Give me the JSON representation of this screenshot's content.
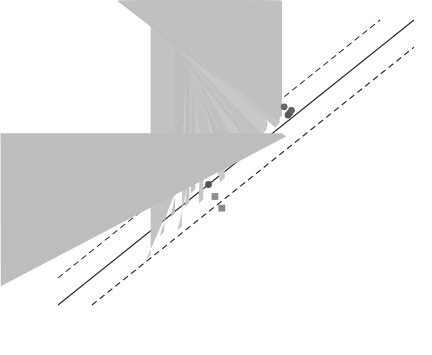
{
  "figure": {
    "background": "#ffffff",
    "frame_color": "#3a3a3a"
  },
  "axes": {
    "x": {
      "label_parts": {
        "prefix": "实测EC",
        "sub1": "10add",
        "mid1": "/NOEC",
        "sub2": "add",
        "mid2": "/LOEC",
        "sub3": "add",
        "suffix": "/(mg/kg)"
      },
      "label_plain": "实测EC10add/NOECadd/LOECadd/(mg/kg)",
      "ticks": [
        "0.1",
        "1",
        "10",
        "100",
        "1000",
        "10000"
      ],
      "min": 0.1,
      "max": 10000,
      "scale": "log"
    },
    "y": {
      "label_parts": {
        "prefix": "预测EC",
        "sub1": "10add",
        "mid1": "/NOEC",
        "sub2": "add",
        "mid2": "/LOEC",
        "sub3": "add",
        "suffix": "/(mg/kg)"
      },
      "label_plain": "预测EC10add/NOECadd/LOECadd/(mg/kg)",
      "ticks": [
        "0.1",
        "1",
        "10",
        "100",
        "1000",
        "10000"
      ],
      "min": 0.1,
      "max": 10000,
      "scale": "log"
    }
  },
  "species_legend": [
    {
      "label": "Cucumis sativus",
      "suffix": " L.",
      "italic": true,
      "color": "#8c8c8c"
    },
    {
      "label": "Ligustrum japonicum",
      "suffix": "",
      "italic": true,
      "color": "#595959"
    },
    {
      "label": "Lactuca sativa",
      "suffix": " T.",
      "italic": true,
      "color": "#d5d5d5"
    },
    {
      "label": "Triticum aestivum",
      "suffix": " L.",
      "italic": true,
      "color": "#c4c4c4"
    },
    {
      "label": "Eisenia andrei",
      "suffix": "",
      "italic": true,
      "color": "#616161"
    },
    {
      "label": "Lumbricus terrestris",
      "suffix": "",
      "italic": true,
      "color": "#9a9a9a"
    },
    {
      "label": "Aporrectodea caliginosa",
      "suffix": "",
      "italic": true,
      "color": "#9e9e9e"
    },
    {
      "label": "Eisenia fetida",
      "suffix": "",
      "italic": true,
      "color": "#8f8f8f"
    },
    {
      "label": "Enchytraeus crypticus",
      "suffix": "",
      "italic": true,
      "color": "#7a7a7a"
    },
    {
      "label": "Spinacia oleracea",
      "suffix": " L.",
      "italic": true,
      "color": "#a8a8a8"
    },
    {
      "label": "Sinella curviseta",
      "suffix": "",
      "italic": true,
      "color": "#4f4f4f"
    },
    {
      "label": "Hordeum vulgare",
      "suffix": " L.",
      "italic": true,
      "color": "#636363"
    },
    {
      "label": "PNR",
      "suffix": "",
      "italic": false,
      "color": "#c9c9c9"
    },
    {
      "label": "STR",
      "suffix": "",
      "italic": false,
      "color": "#dcdcdc"
    },
    {
      "label": "Q67",
      "suffix": "",
      "italic": false,
      "color": "#b0b0b0"
    }
  ],
  "symbol_legend": [
    {
      "name": "Cd",
      "sup": "",
      "shape": "circle"
    },
    {
      "name": "Pb",
      "sup": "",
      "shape": "circle"
    },
    {
      "name": "Zn",
      "sup": "",
      "shape": "circle"
    },
    {
      "name": "As",
      "sup": "3+",
      "shape": "square"
    },
    {
      "name": "Cu",
      "sup": "",
      "shape": "triangle-down"
    },
    {
      "name": "Cr",
      "sup": "6+",
      "shape": "triangle-up"
    },
    {
      "name": "Ni",
      "sup": "",
      "shape": "diamond"
    },
    {
      "name": "Sb",
      "sup": "3+",
      "shape": "star"
    }
  ],
  "line_legend": [
    {
      "label": "1：1线",
      "style": "solid"
    },
    {
      "label": "3倍范围",
      "style": "dashed"
    }
  ],
  "chart_data": {
    "type": "scatter",
    "title": "",
    "xlabel": "实测EC10add/NOECadd/LOECadd/(mg/kg)",
    "ylabel": "预测EC10add/NOECadd/LOECadd/(mg/kg)",
    "xlim": [
      0.1,
      10000
    ],
    "ylim": [
      0.1,
      10000
    ],
    "xscale": "log",
    "yscale": "log",
    "grid": false,
    "legend_position": "inside-top-left-and-top-center",
    "reference_lines": [
      {
        "name": "1:1线",
        "type": "identity",
        "slope": 1,
        "factor": 1,
        "style": "solid"
      },
      {
        "name": "3倍范围 upper",
        "type": "band",
        "slope": 1,
        "factor": 3,
        "style": "dashed"
      },
      {
        "name": "3倍范围 lower",
        "type": "band",
        "slope": 1,
        "factor": 0.3333,
        "style": "dashed"
      }
    ],
    "points": [
      {
        "x": 2.0,
        "y": 0.62,
        "shape": "triangle-up",
        "color": "#c2c2c2"
      },
      {
        "x": 3.1,
        "y": 1.6,
        "shape": "triangle-up",
        "color": "#c2c2c2"
      },
      {
        "x": 5.5,
        "y": 2.0,
        "shape": "triangle-up",
        "color": "#c8c8c8"
      },
      {
        "x": 4.4,
        "y": 3.4,
        "shape": "triangle-up",
        "color": "#bdbdbd"
      },
      {
        "x": 7.0,
        "y": 5.2,
        "shape": "triangle-up",
        "color": "#c4c4c4"
      },
      {
        "x": 8.5,
        "y": 9.0,
        "shape": "triangle-up",
        "color": "#bfbfbf"
      },
      {
        "x": 6.2,
        "y": 11.0,
        "shape": "triangle-up",
        "color": "#cccccc"
      },
      {
        "x": 11.0,
        "y": 6.0,
        "shape": "triangle-up",
        "color": "#c6c6c6"
      },
      {
        "x": 13.0,
        "y": 13.0,
        "shape": "circle",
        "color": "#555555"
      },
      {
        "x": 16.0,
        "y": 8.0,
        "shape": "square",
        "color": "#8f8f8f"
      },
      {
        "x": 15.0,
        "y": 19.0,
        "shape": "triangle-up",
        "color": "#c2c2c2"
      },
      {
        "x": 20.0,
        "y": 5.0,
        "shape": "square",
        "color": "#8a8a8a"
      },
      {
        "x": 22.0,
        "y": 14.0,
        "shape": "triangle-up",
        "color": "#c9c9c9"
      },
      {
        "x": 26.0,
        "y": 24.0,
        "shape": "triangle-up",
        "color": "#bdbdbd"
      },
      {
        "x": 30.0,
        "y": 45.0,
        "shape": "triangle-up",
        "color": "#c4c4c4"
      },
      {
        "x": 34.0,
        "y": 30.0,
        "shape": "triangle-up",
        "color": "#c0c0c0"
      },
      {
        "x": 40.0,
        "y": 62.0,
        "shape": "circle",
        "color": "#6b6b6b"
      },
      {
        "x": 44.0,
        "y": 42.0,
        "shape": "triangle-up",
        "color": "#c8c8c8"
      },
      {
        "x": 48.0,
        "y": 88.0,
        "shape": "triangle-up",
        "color": "#bfbfbf"
      },
      {
        "x": 55.0,
        "y": 120.0,
        "shape": "circle",
        "color": "#bcbcbc"
      },
      {
        "x": 60.0,
        "y": 75.0,
        "shape": "triangle-up",
        "color": "#c5c5c5"
      },
      {
        "x": 64.0,
        "y": 175.0,
        "shape": "circle",
        "color": "#c6c6c6"
      },
      {
        "x": 70.0,
        "y": 66.0,
        "shape": "triangle-up",
        "color": "#c1c1c1"
      },
      {
        "x": 78.0,
        "y": 150.0,
        "shape": "circle",
        "color": "#a3a3a3"
      },
      {
        "x": 85.0,
        "y": 98.0,
        "shape": "triangle-up",
        "color": "#c9c9c9"
      },
      {
        "x": 92.0,
        "y": 330.0,
        "shape": "circle",
        "color": "#c2c2c2"
      },
      {
        "x": 100.0,
        "y": 200.0,
        "shape": "triangle-up",
        "color": "#bebebe"
      },
      {
        "x": 110.0,
        "y": 420.0,
        "shape": "circle",
        "color": "#3f3f3f"
      },
      {
        "x": 120.0,
        "y": 260.0,
        "shape": "circle",
        "color": "#9c9c9c"
      },
      {
        "x": 130.0,
        "y": 130.0,
        "shape": "triangle-up",
        "color": "#c4c4c4"
      },
      {
        "x": 140.0,
        "y": 175.0,
        "shape": "triangle-up",
        "color": "#c0c0c0"
      },
      {
        "x": 150.0,
        "y": 300.0,
        "shape": "circle",
        "color": "#666666"
      },
      {
        "x": 160.0,
        "y": 90.0,
        "shape": "triangle-down",
        "color": "#bdbdbd"
      },
      {
        "x": 170.0,
        "y": 215.0,
        "shape": "circle",
        "color": "#5a5a5a"
      },
      {
        "x": 180.0,
        "y": 235.0,
        "shape": "circle",
        "color": "#585858"
      },
      {
        "x": 190.0,
        "y": 260.0,
        "shape": "circle",
        "color": "#616161"
      },
      {
        "x": 200.0,
        "y": 115.0,
        "shape": "star",
        "color": "#6e6e6e"
      },
      {
        "x": 210.0,
        "y": 75.0,
        "shape": "triangle-down",
        "color": "#c2c2c2"
      },
      {
        "x": 230.0,
        "y": 145.0,
        "shape": "triangle-down",
        "color": "#b8b8b8"
      },
      {
        "x": 250.0,
        "y": 58.0,
        "shape": "star",
        "color": "#b4b4b4"
      },
      {
        "x": 270.0,
        "y": 46.0,
        "shape": "star",
        "color": "#6a6a6a"
      },
      {
        "x": 290.0,
        "y": 300.0,
        "shape": "circle",
        "color": "#4a4a4a"
      },
      {
        "x": 310.0,
        "y": 180.0,
        "shape": "diamond",
        "color": "#9f9f9f"
      },
      {
        "x": 330.0,
        "y": 52.0,
        "shape": "diamond",
        "color": "#a8a8a8"
      },
      {
        "x": 360.0,
        "y": 640.0,
        "shape": "circle",
        "color": "#4e4e4e"
      },
      {
        "x": 400.0,
        "y": 420.0,
        "shape": "square",
        "color": "#8d8d8d"
      },
      {
        "x": 440.0,
        "y": 250.0,
        "shape": "square",
        "color": "#888888"
      },
      {
        "x": 480.0,
        "y": 330.0,
        "shape": "triangle-down",
        "color": "#b6b6b6"
      },
      {
        "x": 520.0,
        "y": 620.0,
        "shape": "circle",
        "color": "#555555"
      },
      {
        "x": 560.0,
        "y": 150.0,
        "shape": "diamond",
        "color": "#a2a2a2"
      },
      {
        "x": 620.0,
        "y": 860.0,
        "shape": "circle",
        "color": "#4d4d4d"
      },
      {
        "x": 700.0,
        "y": 420.0,
        "shape": "triangle-down",
        "color": "#bababa"
      },
      {
        "x": 780.0,
        "y": 1150.0,
        "shape": "star",
        "color": "#7a7a7a"
      },
      {
        "x": 860.0,
        "y": 300.0,
        "shape": "diamond",
        "color": "#a5a5a5"
      },
      {
        "x": 1000.0,
        "y": 760.0,
        "shape": "circle",
        "color": "#4b4b4b"
      },
      {
        "x": 1150.0,
        "y": 2100.0,
        "shape": "circle",
        "color": "#5f5f5f"
      },
      {
        "x": 1300.0,
        "y": 1550.0,
        "shape": "circle",
        "color": "#565656"
      },
      {
        "x": 1500.0,
        "y": 620.0,
        "shape": "triangle-down",
        "color": "#b9b9b9"
      },
      {
        "x": 1700.0,
        "y": 1250.0,
        "shape": "circle",
        "color": "#8b8b8b"
      },
      {
        "x": 2000.0,
        "y": 880.0,
        "shape": "circle",
        "color": "#bcbcbc"
      },
      {
        "x": 2300.0,
        "y": 2600.0,
        "shape": "circle",
        "color": "#5b5b5b"
      },
      {
        "x": 2700.0,
        "y": 1350.0,
        "shape": "circle",
        "color": "#606060"
      },
      {
        "x": 3200.0,
        "y": 3300.0,
        "shape": "star",
        "color": "#707070"
      },
      {
        "x": 3800.0,
        "y": 1400.0,
        "shape": "circle",
        "color": "#4f4f4f"
      },
      {
        "x": 4400.0,
        "y": 1500.0,
        "shape": "circle",
        "color": "#5c5c5c"
      },
      {
        "x": 5200.0,
        "y": 900.0,
        "shape": "circle",
        "color": "#c0c0c0"
      },
      {
        "x": 6200.0,
        "y": 2400.0,
        "shape": "circle",
        "color": "#bdbdbd"
      },
      {
        "x": 2600.0,
        "y": 520.0,
        "shape": "diamond",
        "color": "#a6a6a6"
      },
      {
        "x": 900.0,
        "y": 3600.0,
        "shape": "circle",
        "color": "#8e8e8e"
      },
      {
        "x": 1400.0,
        "y": 4200.0,
        "shape": "circle",
        "color": "#636363"
      },
      {
        "x": 105.0,
        "y": 1050.0,
        "shape": "circle",
        "color": "#c5c5c5"
      },
      {
        "x": 1.1,
        "y": 0.85,
        "shape": "triangle-up",
        "color": "#c9c9c9"
      },
      {
        "x": 125.0,
        "y": 470.0,
        "shape": "triangle-up",
        "color": "#bcbcbc"
      },
      {
        "x": 58.0,
        "y": 230.0,
        "shape": "triangle-up",
        "color": "#c7c7c7"
      }
    ]
  }
}
